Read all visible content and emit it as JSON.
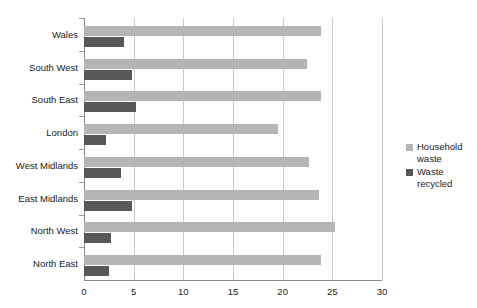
{
  "chart_data": {
    "type": "bar",
    "orientation": "horizontal",
    "title": "",
    "xlabel": "",
    "ylabel": "",
    "xlim": [
      0,
      30
    ],
    "xticks": [
      0,
      5,
      10,
      15,
      20,
      25,
      30
    ],
    "grid": "vertical",
    "legend_position": "right",
    "categories": [
      "Wales",
      "South West",
      "South East",
      "London",
      "West Midlands",
      "East Midlands",
      "North West",
      "North East"
    ],
    "series": [
      {
        "name": "Household waste",
        "color": "#b5b5b5",
        "values": [
          23.9,
          22.4,
          23.9,
          19.5,
          22.7,
          23.7,
          25.3,
          23.9
        ]
      },
      {
        "name": "Waste recycled",
        "color": "#585858",
        "values": [
          4.0,
          4.8,
          5.2,
          2.2,
          3.7,
          4.8,
          2.7,
          2.5
        ]
      }
    ]
  },
  "legend": {
    "items": [
      {
        "label": "Household\nwaste",
        "color": "#b5b5b5"
      },
      {
        "label": "Waste\nrecycled",
        "color": "#585858"
      }
    ]
  }
}
